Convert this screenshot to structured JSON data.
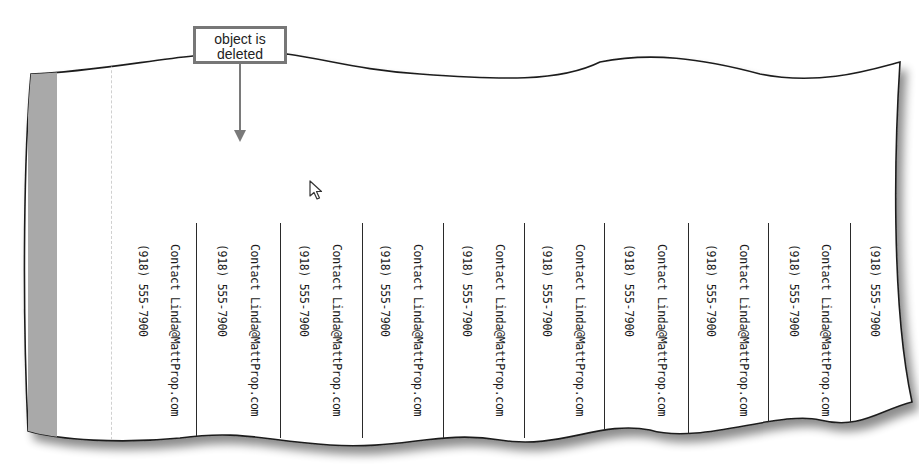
{
  "callout": {
    "line1": "object is",
    "line2": "deleted"
  },
  "columns": [
    {
      "phone": "(918) 555-7900",
      "contact": "Contact Linda@MattProp.com"
    },
    {
      "phone": "(918) 555-7900",
      "contact": "Contact Linda@MattProp.com"
    },
    {
      "phone": "(918) 555-7900",
      "contact": "Contact Linda@MattProp.com"
    },
    {
      "phone": "(918) 555-7900",
      "contact": "Contact Linda@MattProp.com"
    },
    {
      "phone": "(918) 555-7900",
      "contact": "Contact Linda@MattProp.com"
    },
    {
      "phone": "(918) 555-7900",
      "contact": "Contact Linda@MattProp.com"
    },
    {
      "phone": "(918) 555-7900",
      "contact": "Contact Linda@MattProp.com"
    },
    {
      "phone": "(918) 555-7900",
      "contact": "Contact Linda@MattProp.com"
    },
    {
      "phone": "(918) 555-7900",
      "contact": "Contact Linda@MattProp.com"
    },
    {
      "phone": "(918) 555-7900"
    }
  ],
  "icons": {
    "cursor": "mouse-pointer-arrow",
    "arrow": "down-arrow"
  },
  "colors": {
    "strip_gray": "#a9a9a9",
    "callout_border": "#777777",
    "separator": "#2a2a2a"
  }
}
